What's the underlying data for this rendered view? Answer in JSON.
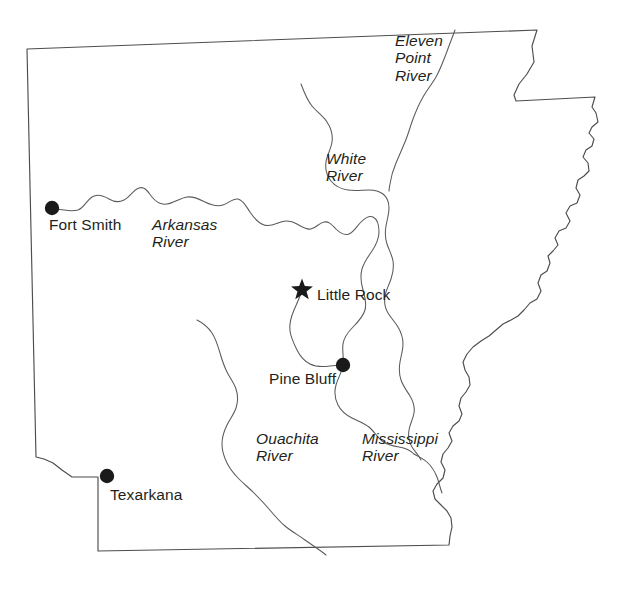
{
  "map": {
    "title": "Arkansas",
    "subject": "State of Arkansas with major rivers and cities",
    "background_color": "#ffffff",
    "outline_color": "#4d4d4d",
    "river_color": "#5a5a5a",
    "label_color": "#231f20",
    "marker_color": "#1a1a1a"
  },
  "cities": [
    {
      "name": "Fort Smith",
      "label": "Fort Smith",
      "marker": "filled-circle",
      "marker_x": 52,
      "marker_y": 208,
      "label_x": 49,
      "label_y": 216
    },
    {
      "name": "Little Rock",
      "label": "Little Rock",
      "marker": "filled-star",
      "marker_x": 302,
      "marker_y": 290,
      "label_x": 317,
      "label_y": 286
    },
    {
      "name": "Pine Bluff",
      "label": "Pine Bluff",
      "marker": "filled-circle",
      "marker_x": 343,
      "marker_y": 365,
      "label_x": 269,
      "label_y": 370
    },
    {
      "name": "Texarkana",
      "label": "Texarkana",
      "marker": "filled-circle",
      "marker_x": 107,
      "marker_y": 476,
      "label_x": 110,
      "label_y": 486
    }
  ],
  "rivers": [
    {
      "name": "Arkansas River",
      "lines": [
        "Arkansas",
        "River"
      ],
      "label_x": 152,
      "label_y": 216
    },
    {
      "name": "White River",
      "lines": [
        "White",
        "River"
      ],
      "label_x": 326,
      "label_y": 150
    },
    {
      "name": "Eleven Point River",
      "lines": [
        "Eleven",
        "Point",
        "River"
      ],
      "label_x": 395,
      "label_y": 32
    },
    {
      "name": "Ouachita River",
      "lines": [
        "Ouachita",
        "River"
      ],
      "label_x": 256,
      "label_y": 430
    },
    {
      "name": "Mississippi River",
      "lines": [
        "Mississippi",
        "River"
      ],
      "label_x": 362,
      "label_y": 430
    }
  ],
  "geometry": {
    "state_border_path": "M 27,49 L 537,30 L 532,46 L 534,62 L 527,74 L 519,84 L 514,95 L 516,101 L 595,97 L 592,107 L 596,113 L 598,122 L 592,127 L 589,133 L 594,139 L 592,146 L 586,150 L 583,157 L 588,163 L 589,171 L 584,176 L 578,180 L 576,188 L 580,195 L 577,203 L 570,206 L 566,213 L 570,221 L 566,228 L 559,231 L 555,238 L 558,245 L 553,251 L 548,256 L 550,263 L 547,271 L 541,275 L 538,283 L 541,291 L 537,299 L 530,303 L 524,310 L 518,316 L 511,320 L 503,324 L 496,330 L 489,336 L 481,341 L 473,347 L 467,354 L 463,362 L 465,370 L 469,377 L 470,385 L 466,392 L 461,398 L 459,406 L 462,414 L 459,421 L 453,426 L 449,433 L 452,441 L 448,448 L 443,454 L 441,462 L 445,470 L 443,478 L 437,484 L 433,491 L 435,499 L 441,505 L 447,511 L 451,518 L 452,527 L 450,536 L 449,545 L 98,551 L 98,477 L 72,477 L 62,470 L 53,463 L 44,459 L 36,457 L 27,49 Z",
    "arkansas_river_path": "M 52,208 C 62,210 70,212 78,210 C 84,208 86,201 92,197 C 98,193 104,196 109,199 C 114,202 118,203 124,200 C 130,197 133,190 139,188 C 145,186 148,192 152,197 C 156,202 160,205 167,204 C 174,203 180,198 187,197 C 194,196 199,199 205,202 C 211,205 217,207 223,205 C 229,203 233,198 238,199 C 243,200 246,206 250,212 C 254,218 258,223 264,225 C 270,227 275,224 281,222 C 287,220 292,221 297,224 C 302,227 306,230 311,229 C 316,228 319,223 324,222 C 329,221 332,225 336,229 C 340,233 344,236 349,234 C 354,232 357,226 361,222 C 365,218 369,215 373,217 C 377,219 379,225 379,232 C 379,239 376,245 372,251 C 368,257 364,262 362,269 C 360,276 361,283 363,290 C 365,297 367,303 365,310 C 363,317 358,322 353,327 C 348,332 344,337 343,344 C 342,351 344,358 343,365 C 342,372 338,378 336,385 C 334,392 335,399 338,405 C 341,411 346,415 352,418 C 358,421 364,423 369,427 C 374,431 377,437 382,441 C 387,445 393,446 399,447 C 405,448 410,450 414,454",
    "arkansas_river_upper_branch": "M 302,290 C 300,297 297,303 294,310 C 291,317 289,324 290,331 C 291,338 294,344 297,350 C 300,356 304,361 310,364 C 316,367 323,367 330,366 C 335,365.4 339,365.2 343,365",
    "white_river_path": "M 301,84 C 304,92 307,100 312,106 C 317,112 323,116 327,122 C 331,128 333,135 332,142 C 331,149 327,155 326,162 C 325,169 327,176 331,181 C 335,186 341,189 348,190 C 355,191 362,190 369,190 C 374,190 379,191 383,194 C 387,197 389,202 389,208 C 389,214 387,220 386,226 C 385,232 385,238 387,244 C 389,250 392,255 393,261 C 394,267 393,273 391,279 C 389,285 386,290 385,296 C 384,302 385,308 388,313 C 391,318 395,322 398,327 C 401,332 403,338 403,344 C 403,350 401,356 400,362 C 399,368 399,374 401,380 C 403,386 407,391 410,396 C 413,401 415,407 414,413 C 413,419 410,424 409,430 C 408,436 409,442 412,447 C 415,452 419,455 421,460",
    "eleven_point_river_path": "M 455,30 C 452,38 449,46 446,54 C 443,62 440,70 436,77 C 432,84 427,90 423,97 C 419,104 416,111 413,119 C 410,127 408,135 405,142 C 402,149 399,156 396,163 C 393,170 391,177 390,184 C 389.5,187 389,189 389,191",
    "ouachita_river_path": "M 197,320 C 203,323 208,327 212,333 C 216,339 218,346 220,353 C 222,360 224,366 227,372 C 230,378 234,383 236,389 C 238,395 238,402 236,408 C 234,414 230,419 227,425 C 224,431 222,437 222,444 C 222,451 224,457 227,463 C 230,469 234,474 239,479 C 244,484 249,488 254,493 C 259,498 264,503 269,509 C 274,515 279,521 285,526 C 291,531 298,535 305,540 C 312,545 320,550 326,555",
    "mississippi_river_path": "M 414,454 C 419,457 424,459 428,463 C 432,467 435,472 437,477 C 439,482 440,488 442,493"
  },
  "legend": {
    "capital_symbol": "star",
    "city_symbol": "circle"
  }
}
